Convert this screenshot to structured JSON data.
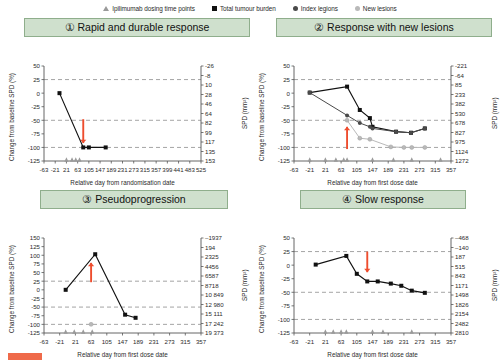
{
  "legend": {
    "items": [
      {
        "label": "Ipilimumab dosing time points",
        "icon": "triangle-marker-icon",
        "color": "#9a9a9a"
      },
      {
        "label": "Total tumour burden",
        "icon": "square-marker-icon",
        "color": "#111111"
      },
      {
        "label": "Index legions",
        "icon": "circle-marker-icon",
        "color": "#4a4a4a"
      },
      {
        "label": "New lesions",
        "icon": "circle-light-marker-icon",
        "color": "#b9b9b9"
      }
    ]
  },
  "caption": {
    "chip_color": "#ef6a4a",
    "text": ""
  },
  "chart_data": [
    {
      "id": "panel1",
      "type": "line",
      "title": "① Rapid and durable response",
      "xlabel": "Relative day from randomisation date",
      "ylabel": "Change from baseline SPD (%)",
      "y2label": "SPD (mm²)",
      "xlim": [
        -63,
        525
      ],
      "ylim": [
        -125,
        50
      ],
      "xticks": [
        -63,
        -21,
        21,
        63,
        105,
        147,
        189,
        231,
        273,
        315,
        357,
        399,
        441,
        483,
        525
      ],
      "yticks": [
        50,
        25,
        0,
        -25,
        -50,
        -75,
        -100,
        -125
      ],
      "y2ticks": [
        153,
        135,
        117,
        99,
        82,
        64,
        46,
        28,
        10,
        -8,
        -26
      ],
      "gridlines": [
        25,
        -50,
        -100
      ],
      "arrow": {
        "x": 84,
        "y_from": -48,
        "y_to": -92,
        "color": "#ee4d2e",
        "direction": "down"
      },
      "series": [
        {
          "name": "Total tumour burden",
          "marker": "square",
          "color": "#111111",
          "points": [
            [
              -5,
              0
            ],
            [
              84,
              -100
            ],
            [
              105,
              -100
            ],
            [
              168,
              -100
            ]
          ]
        }
      ],
      "dosing_points": [
        21,
        42,
        56,
        70
      ]
    },
    {
      "id": "panel2",
      "type": "line",
      "title": "② Response with new lesions",
      "xlabel": "Relative day from first dose date",
      "ylabel": "Change from baseline SPD (%)",
      "y2label": "SPD (mm²)",
      "xlim": [
        -63,
        357
      ],
      "ylim": [
        -125,
        50
      ],
      "xticks": [
        -63,
        -21,
        21,
        63,
        105,
        147,
        189,
        231,
        273,
        315,
        357
      ],
      "yticks": [
        50,
        25,
        0,
        -25,
        -50,
        -75,
        -100,
        -125
      ],
      "y2ticks": [
        1272,
        1124,
        975,
        827,
        678,
        530,
        382,
        233,
        85,
        -64,
        -221
      ],
      "gridlines": [
        25,
        -50,
        -100
      ],
      "arrow": {
        "x": 79,
        "y_from": -103,
        "y_to": -62,
        "color": "#ee4d2e",
        "direction": "up"
      },
      "series": [
        {
          "name": "Total tumour burden",
          "marker": "square",
          "color": "#111111",
          "points": [
            [
              -21,
              1
            ],
            [
              79,
              12
            ],
            [
              113,
              -31
            ],
            [
              140,
              -46
            ],
            [
              147,
              -62
            ],
            [
              210,
              -71
            ],
            [
              250,
              -73
            ],
            [
              287,
              -65
            ]
          ]
        },
        {
          "name": "Index legions",
          "marker": "circle",
          "color": "#4a4a4a",
          "points": [
            [
              -21,
              1
            ],
            [
              79,
              -41
            ],
            [
              113,
              -55
            ],
            [
              140,
              -62
            ],
            [
              147,
              -65
            ],
            [
              210,
              -71
            ],
            [
              250,
              -73
            ],
            [
              287,
              -65
            ]
          ]
        },
        {
          "name": "New lesions",
          "marker": "circle-light",
          "color": "#b9b9b9",
          "points": [
            [
              79,
              -50
            ],
            [
              113,
              -83
            ],
            [
              140,
              -85
            ],
            [
              196,
              -99
            ],
            [
              231,
              -100
            ],
            [
              252,
              -100
            ],
            [
              287,
              -100
            ]
          ]
        }
      ],
      "dosing_points": [
        -21,
        21,
        49,
        70,
        79,
        147,
        203,
        252,
        329
      ]
    },
    {
      "id": "panel3",
      "type": "line",
      "title": "③ Pseudoprogression",
      "xlabel": "Relative day from first dose date",
      "ylabel": "Change from baseline SPD (%)",
      "y2label": "SPD (mm²)",
      "xlim": [
        -63,
        357
      ],
      "ylim": [
        -125,
        150
      ],
      "xticks": [
        -63,
        -21,
        21,
        63,
        105,
        147,
        189,
        231,
        273,
        315,
        357
      ],
      "yticks": [
        150,
        125,
        100,
        75,
        50,
        25,
        0,
        -25,
        -50,
        -75,
        -100,
        -125
      ],
      "y2ticks": [
        "19 373",
        "17 242",
        "15 111",
        "12 980",
        "10 849",
        "8718",
        "6587",
        "4456",
        "2325",
        "194",
        "–1937"
      ],
      "gridlines": [
        25,
        -50,
        -100
      ],
      "arrow": {
        "x": 63,
        "y_from": 22,
        "y_to": 78,
        "color": "#ee4d2e",
        "direction": "up"
      },
      "series": [
        {
          "name": "Total tumour burden",
          "marker": "square",
          "color": "#111111",
          "points": [
            [
              -5,
              0
            ],
            [
              74,
              103
            ],
            [
              154,
              -72
            ],
            [
              182,
              -81
            ]
          ]
        },
        {
          "name": "New lesions",
          "marker": "circle-light",
          "color": "#b9b9b9",
          "points": [
            [
              63,
              -100
            ]
          ]
        }
      ],
      "dosing_points": [
        -5,
        18,
        42,
        66
      ]
    },
    {
      "id": "panel4",
      "type": "line",
      "title": "④ Slow response",
      "xlabel": "Relative day from first dose date",
      "ylabel": "Change from baseline SPD (%)",
      "y2label": "SPD (mm²)",
      "xlim": [
        -63,
        357
      ],
      "ylim": [
        -125,
        50
      ],
      "xticks": [
        -63,
        -21,
        21,
        63,
        105,
        147,
        189,
        231,
        273,
        315,
        357
      ],
      "yticks": [
        50,
        25,
        0,
        -25,
        -50,
        -75,
        -100,
        -125
      ],
      "y2ticks": [
        2810,
        2482,
        2154,
        1826,
        1498,
        1171,
        843,
        515,
        187,
        "–140",
        "–468"
      ],
      "gridlines": [
        25,
        -50,
        -100
      ],
      "arrow": {
        "x": 133,
        "y_from": 25,
        "y_to": -13,
        "color": "#ee4d2e",
        "direction": "down"
      },
      "series": [
        {
          "name": "Total tumour burden",
          "marker": "square",
          "color": "#111111",
          "points": [
            [
              -5,
              1
            ],
            [
              77,
              17
            ],
            [
              105,
              -16
            ],
            [
              133,
              -30
            ],
            [
              161,
              -30
            ],
            [
              196,
              -34
            ],
            [
              224,
              -38
            ],
            [
              252,
              -47
            ],
            [
              287,
              -51
            ]
          ]
        }
      ],
      "dosing_points": [
        21,
        42,
        63,
        77,
        147,
        175,
        252
      ]
    }
  ]
}
